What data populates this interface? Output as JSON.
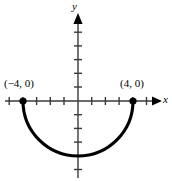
{
  "figure": {
    "kind": "coordinate-plane-graph",
    "background_color": "#ffffff",
    "ink_color": "#000000",
    "axis_color": "#3a3a3a"
  },
  "axes": {
    "x_label": "x",
    "y_label": "y",
    "origin_px": [
      78,
      101
    ],
    "unit_px": 13.7,
    "x_range_px": [
      5,
      160
    ],
    "y_range_px": [
      14,
      178
    ],
    "x_ticks": [
      -5,
      -4,
      -3,
      -2,
      -1,
      1,
      2,
      3,
      4,
      5
    ],
    "y_ticks": [
      5,
      4,
      3,
      2,
      1,
      -1,
      -2,
      -3,
      -4,
      -5
    ],
    "tick_half_length_px": 4,
    "has_x_arrow": true,
    "has_y_arrow": true
  },
  "curve": {
    "type": "semicircle",
    "orientation": "lower",
    "center": [
      0,
      0
    ],
    "radius": 4,
    "stroke_width_px": 3,
    "stroke_color": "#000000",
    "endpoints": [
      {
        "x": -4,
        "y": 0,
        "label": "(−4, 0)"
      },
      {
        "x": 4,
        "y": 0,
        "label": "(4, 0)"
      }
    ],
    "vertex": {
      "x": 0,
      "y": -4
    }
  },
  "labels": {
    "left_point": "(−4, 0)",
    "right_point": "(4, 0)"
  },
  "markers": {
    "radius_px": 3.6,
    "fill": "#000000"
  }
}
